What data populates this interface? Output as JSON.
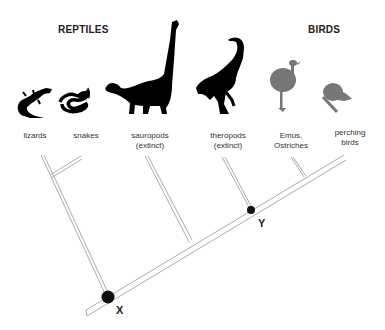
{
  "groups": {
    "reptiles": "REPTILES",
    "birds": "BIRDS"
  },
  "taxa": [
    {
      "name": "lizards",
      "line1": "lizards",
      "line2": "",
      "icon": "lizard-icon",
      "color": "#000000"
    },
    {
      "name": "snakes",
      "line1": "snakes",
      "line2": "",
      "icon": "snake-icon",
      "color": "#000000"
    },
    {
      "name": "sauropods",
      "line1": "sauropods",
      "line2": "(extinct)",
      "icon": "sauropod-icon",
      "color": "#000000"
    },
    {
      "name": "theropods",
      "line1": "theropods",
      "line2": "(extinct)",
      "icon": "theropod-icon",
      "color": "#000000"
    },
    {
      "name": "emus-ostriches",
      "line1": "Emus,",
      "line2": "Ostriches",
      "icon": "ostrich-icon",
      "color": "#777777"
    },
    {
      "name": "perching-birds",
      "line1": "perching",
      "line2": "birds",
      "icon": "perching-bird-icon",
      "color": "#777777"
    }
  ],
  "nodes": {
    "x": "X",
    "y": "Y"
  },
  "colors": {
    "silhouette_reptile": "#000000",
    "silhouette_bird": "#777777",
    "branch": "#999999",
    "node": "#111111"
  }
}
